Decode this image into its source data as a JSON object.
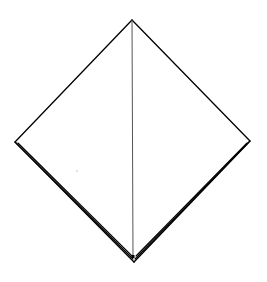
{
  "diagram": {
    "kind": "folded-paper-diamond",
    "background": "#ffffff",
    "stroke_color": "#000000",
    "center_line_color": "#555555",
    "vertices": {
      "top": [
        132,
        20
      ],
      "left": [
        15,
        142
      ],
      "right": [
        250,
        141
      ],
      "bottom": [
        134,
        262
      ]
    },
    "upper_edges": [
      {
        "from": [
          132,
          20
        ],
        "to": [
          15,
          142
        ]
      },
      {
        "from": [
          132,
          20
        ],
        "to": [
          250,
          141
        ]
      }
    ],
    "center_line": {
      "from": [
        132,
        20
      ],
      "to": [
        133,
        258
      ]
    },
    "lower_left_layers": [
      {
        "from": [
          15,
          142
        ],
        "to": [
          134,
          262
        ]
      },
      {
        "from": [
          16,
          143
        ],
        "to": [
          133,
          259
        ]
      },
      {
        "from": [
          18,
          143
        ],
        "to": [
          132,
          256
        ]
      }
    ],
    "lower_right_layers": [
      {
        "from": [
          250,
          141
        ],
        "to": [
          134,
          262
        ]
      },
      {
        "from": [
          249,
          142
        ],
        "to": [
          135,
          259
        ]
      },
      {
        "from": [
          247,
          143
        ],
        "to": [
          136,
          256
        ]
      }
    ],
    "stray_dot": {
      "at": [
        77,
        171
      ],
      "color": "#bbbbbb"
    }
  }
}
